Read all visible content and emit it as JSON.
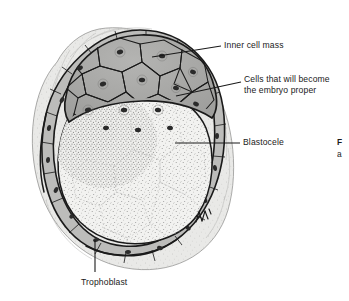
{
  "figure": {
    "type": "biological-illustration",
    "background_color": "#ffffff",
    "ink_color": "#1a1a1a"
  },
  "labels": {
    "inner_cell_mass": "Inner cell mass",
    "embryo_proper_line1": "Cells that will become",
    "embryo_proper_line2": "the embryo proper",
    "blastocele": "Blastocele",
    "trophoblast": "Trophoblast"
  },
  "caption_fragment": {
    "line1": "F",
    "line2": "a"
  },
  "structures": {
    "zona_pellucida": {
      "name": "zona-pellucida",
      "fill": "#e9e9e7"
    },
    "trophoblast": {
      "name": "trophoblast-layer",
      "fill": "#b9b9b7"
    },
    "inner_cell_mass": {
      "name": "inner-cell-mass",
      "fill": "#a9a9a7"
    },
    "blastocele": {
      "name": "blastocele-cavity",
      "fill": "#f0f0ee"
    },
    "nucleus": {
      "name": "cell-nucleus",
      "fill": "#2a2a2a"
    }
  },
  "signature": "artist-signature-mark"
}
